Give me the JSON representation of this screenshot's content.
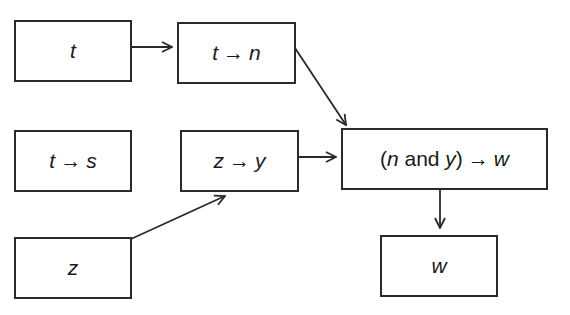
{
  "diagram": {
    "type": "flow",
    "colors": {
      "stroke": "#2a2a2a",
      "background": "#ffffff",
      "text": "#1a1a1a"
    },
    "nodes": [
      {
        "id": "t",
        "parts": [
          "t"
        ]
      },
      {
        "id": "t_to_n",
        "parts": [
          "t",
          "→",
          "n"
        ]
      },
      {
        "id": "t_to_s",
        "parts": [
          "t",
          "→",
          "s"
        ]
      },
      {
        "id": "z_to_y",
        "parts": [
          "z",
          "→",
          "y"
        ]
      },
      {
        "id": "n_and_y_to_w",
        "parts": [
          "(",
          "n",
          " and ",
          "y",
          ")",
          "→",
          "w"
        ]
      },
      {
        "id": "z",
        "parts": [
          "z"
        ]
      },
      {
        "id": "w",
        "parts": [
          "w"
        ]
      }
    ],
    "edges": [
      {
        "from": "t",
        "to": "t_to_n"
      },
      {
        "from": "t_to_n",
        "to": "n_and_y_to_w"
      },
      {
        "from": "z_to_y",
        "to": "n_and_y_to_w"
      },
      {
        "from": "z",
        "to": "z_to_y"
      },
      {
        "from": "n_and_y_to_w",
        "to": "w"
      }
    ]
  }
}
